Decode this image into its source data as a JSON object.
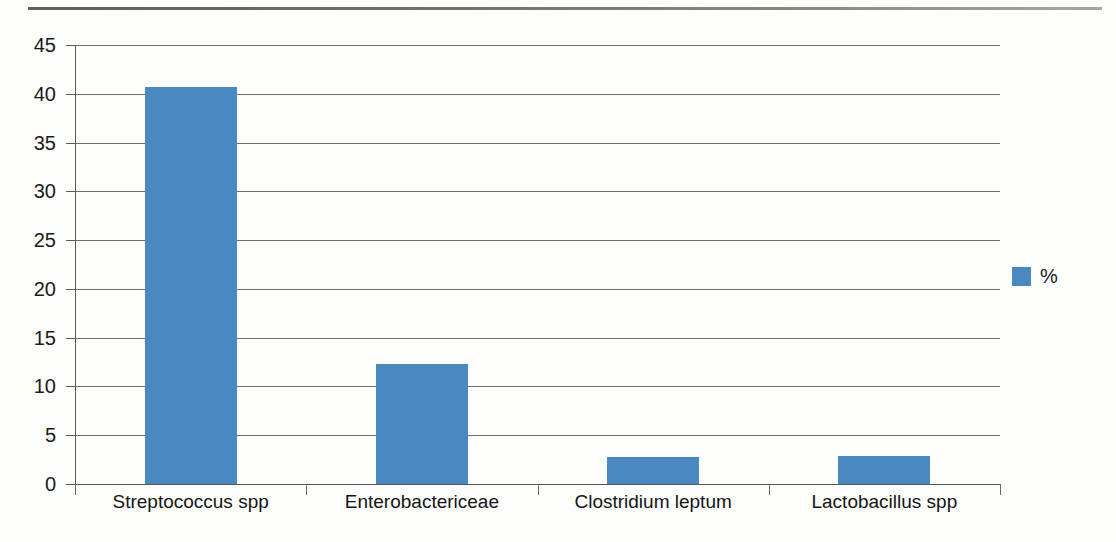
{
  "page": {
    "background_color": "#fdfdfc",
    "top_rule_color": "#4a4a4a"
  },
  "legend": {
    "position": "right",
    "swatch_color": "#4a89c0",
    "label": "%"
  },
  "axis": {
    "y_ticks": [
      "45",
      "40",
      "35",
      "30",
      "25",
      "20",
      "15",
      "10",
      "5",
      "0"
    ],
    "x_categories": [
      "Streptococcus spp",
      "Enterobactericeae",
      "Clostridium leptum",
      "Lactobacillus spp"
    ]
  },
  "chart_data": {
    "type": "bar",
    "title": "",
    "subtitle": "",
    "xlabel": "",
    "ylabel": "",
    "categories": [
      "Streptococcus spp",
      "Enterobactericeae",
      "Clostridium leptum",
      "Lactobacillus spp"
    ],
    "series": [
      {
        "name": "%",
        "color": "#4a89c0",
        "values": [
          40.7,
          12.3,
          2.8,
          2.9
        ]
      }
    ],
    "values": [
      40.7,
      12.3,
      2.8,
      2.9
    ],
    "ylim": [
      0,
      45
    ],
    "y_tick_step": 5,
    "y_tick_labels": [
      "0",
      "5",
      "10",
      "15",
      "20",
      "25",
      "30",
      "35",
      "40",
      "45"
    ],
    "grid": true,
    "grid_axis": "y",
    "grid_color": "#6f6f6f",
    "legend": true,
    "legend_position": "right",
    "legend_entries": [
      "%"
    ],
    "annotations": []
  }
}
